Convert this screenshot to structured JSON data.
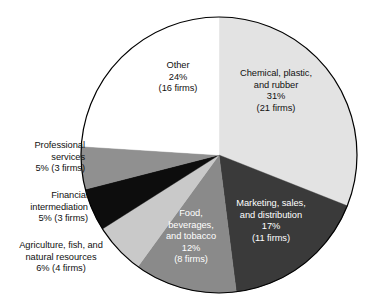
{
  "chart_data": {
    "type": "pie",
    "title": "",
    "subtitle": "",
    "xlabel": "",
    "ylabel": "",
    "legend_position": "none",
    "grid": false,
    "units": "percent of firms",
    "total_firms": 66,
    "start_angle_deg": 0,
    "direction": "clockwise",
    "categories": [
      "Chemical, plastic, and rubber",
      "Marketing, sales, and distribution",
      "Food, beverages, and tobacco",
      "Agriculture, fish, and natural resources",
      "Financial intermediation",
      "Professional services",
      "Other"
    ],
    "values": [
      31,
      17,
      12,
      6,
      5,
      5,
      24
    ],
    "firm_counts": [
      21,
      11,
      8,
      4,
      3,
      3,
      16
    ],
    "colors": [
      "#e3e3e3",
      "#3a3a3a",
      "#8a8a8a",
      "#c9c9c9",
      "#0d0d0d",
      "#909090",
      "#ffffff"
    ],
    "slices": [
      {
        "name": "chemical-plastic-rubber",
        "label_lines": [
          "Chemical, plastic,",
          "and rubber",
          "31%",
          "(21 firms)"
        ],
        "percent": 31,
        "percent_text": "31%",
        "firms": 21,
        "firms_text": "(21 firms)",
        "color": "#e3e3e3",
        "label_placement": "inside",
        "label_color": "dark"
      },
      {
        "name": "marketing-sales-distribution",
        "label_lines": [
          "Marketing, sales,",
          "and distribution",
          "17%",
          "(11 firms)"
        ],
        "percent": 17,
        "percent_text": "17%",
        "firms": 11,
        "firms_text": "(11 firms)",
        "color": "#3a3a3a",
        "label_placement": "inside",
        "label_color": "light"
      },
      {
        "name": "food-beverages-tobacco",
        "label_lines": [
          "Food,",
          "beverages,",
          "and tobacco",
          "12%",
          "(8 firms)"
        ],
        "percent": 12,
        "percent_text": "12%",
        "firms": 8,
        "firms_text": "(8 firms)",
        "color": "#8a8a8a",
        "label_placement": "inside",
        "label_color": "light"
      },
      {
        "name": "agriculture-fish-natural-resources",
        "label_lines": [
          "Agriculture, fish, and",
          "natural resources",
          "6% (4 firms)"
        ],
        "percent": 6,
        "percent_text": "6%",
        "firms": 4,
        "firms_text": "(4 firms)",
        "color": "#c9c9c9",
        "label_placement": "outside",
        "label_color": "dark"
      },
      {
        "name": "financial-intermediation",
        "label_lines": [
          "Financial",
          "intermediation",
          "5% (3 firms)"
        ],
        "percent": 5,
        "percent_text": "5%",
        "firms": 3,
        "firms_text": "(3 firms)",
        "color": "#0d0d0d",
        "label_placement": "outside",
        "label_color": "dark"
      },
      {
        "name": "professional-services",
        "label_lines": [
          "Professional",
          "services",
          "5% (3 firms)"
        ],
        "percent": 5,
        "percent_text": "5%",
        "firms": 3,
        "firms_text": "(3 firms)",
        "color": "#909090",
        "label_placement": "outside",
        "label_color": "dark"
      },
      {
        "name": "other",
        "label_lines": [
          "Other",
          "24%",
          "(16 firms)"
        ],
        "percent": 24,
        "percent_text": "24%",
        "firms": 16,
        "firms_text": "(16 firms)",
        "color": "#ffffff",
        "label_placement": "inside",
        "label_color": "dark"
      }
    ]
  },
  "labels": {
    "chemical": {
      "l1": "Chemical, plastic,",
      "l2": "and rubber",
      "l3": "31%",
      "l4": "(21 firms)"
    },
    "marketing": {
      "l1": "Marketing, sales,",
      "l2": "and distribution",
      "l3": "17%",
      "l4": "(11 firms)"
    },
    "food": {
      "l1": "Food,",
      "l2": "beverages,",
      "l3": "and tobacco",
      "l4": "12%",
      "l5": "(8 firms)"
    },
    "other": {
      "l1": "Other",
      "l2": "24%",
      "l3": "(16 firms)"
    },
    "professional": {
      "l1": "Professional",
      "l2": "services",
      "l3": "5% (3 firms)"
    },
    "financial": {
      "l1": "Financial",
      "l2": "intermediation",
      "l3": "5% (3 firms)"
    },
    "agriculture": {
      "l1": "Agriculture, fish, and",
      "l2": "natural resources",
      "l3": "6% (4 firms)"
    }
  },
  "geometry": {
    "center_x": 219,
    "center_y": 155,
    "radius": 138,
    "outline_color": "#000000",
    "outline_width": 1.2
  }
}
